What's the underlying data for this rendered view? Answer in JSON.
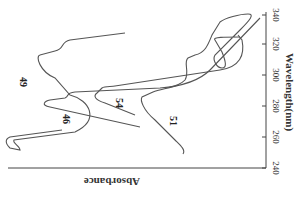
{
  "chart_data": {
    "type": "line",
    "title": "",
    "orientation": "rotated-90",
    "xlabel": "Wavelength(nm)",
    "ylabel": "Absorbance",
    "xlim": [
      240,
      340
    ],
    "x_ticks": [
      "240",
      "260",
      "280",
      "300",
      "320",
      "340"
    ],
    "grid": false,
    "legend": "inline labels",
    "series": [
      {
        "name": "49",
        "label": "49",
        "points": "M 62 130 L 10 137 C 5 139 5 143 10 148 L 20 150 C 20 146 12 143 14 140 L 75 132 C 100 120 90 100 70 95 L 55 78 C 40 72 35 56 40 55 L 55 51 C 65 49 60 42 70 40 L 125 33"
      },
      {
        "name": "46",
        "label": "46",
        "points": "M 140 127 L 50 107 C 40 105 45 101 50 100 L 65 98 C 70 96 65 93 75 92 L 160 88 C 185 86 200 80 210 70 L 260 18"
      },
      {
        "name": "54",
        "label": "54",
        "points": "M 135 115 L 105 103 C 95 100 93 96 97 93 L 102 88 C 105 86 112 87 115 86 L 220 70 C 240 67 245 55 242 40 L 238 35"
      },
      {
        "name": "51",
        "label": "51",
        "points": "M 183 154 C 186 150 180 145 175 140 L 155 120 C 143 110 140 100 142 97 L 153 92 C 162 88 178 88 185 80 C 190 72 183 62 188 58 L 195 55 C 205 53 208 45 212 35 L 220 22 C 225 18 240 14 248 14 C 255 14 250 20 240 30 L 215 55 C 212 60 217 68 222 68 C 227 68 226 62 222 52 L 215 40 C 212 37 225 37 240 37"
      }
    ],
    "colors": {
      "curve": "#555555",
      "axis": "#444444",
      "text": "#333333"
    }
  },
  "axis": {
    "x_title": "Wavelength(nm)",
    "y_title": "Absorbance",
    "ticks": [
      {
        "label": "340",
        "pos": 15
      },
      {
        "label": "320",
        "pos": 44
      },
      {
        "label": "300",
        "pos": 75
      },
      {
        "label": "280",
        "pos": 106
      },
      {
        "label": "260",
        "pos": 137
      },
      {
        "label": "240",
        "pos": 168
      }
    ]
  },
  "labels": {
    "s49": "49",
    "s46": "46",
    "s54": "54",
    "s51": "51"
  }
}
